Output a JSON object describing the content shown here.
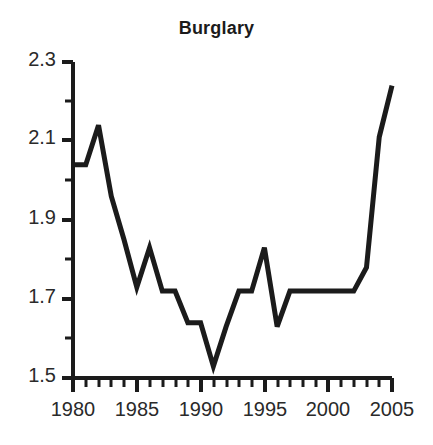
{
  "chart_data": {
    "type": "line",
    "title": "Burglary",
    "xlabel": "",
    "ylabel": "",
    "xlim": [
      1980,
      2005
    ],
    "ylim": [
      1.5,
      2.3
    ],
    "grid": false,
    "legend": null,
    "x_ticks": [
      1980,
      1985,
      1990,
      1995,
      2000,
      2005
    ],
    "x_tick_labels": [
      "1980",
      "1985",
      "1990",
      "1995",
      "2000",
      "2005"
    ],
    "x_minor_tick_interval": 1,
    "y_ticks": [
      1.5,
      1.7,
      1.9,
      2.1,
      2.3
    ],
    "y_tick_labels": [
      "1.5",
      "1.7",
      "1.9",
      "2.1",
      "2.3"
    ],
    "y_minor_ticks": [
      1.6,
      1.8,
      2.0,
      2.2
    ],
    "line_color": "#1b1b1b",
    "line_width": 5,
    "x": [
      1980,
      1981,
      1982,
      1983,
      1984,
      1985,
      1986,
      1987,
      1988,
      1989,
      1990,
      1991,
      1992,
      1993,
      1994,
      1995,
      1996,
      1997,
      1998,
      1999,
      2000,
      2001,
      2002,
      2003,
      2004,
      2005
    ],
    "values": [
      2.04,
      2.04,
      2.14,
      1.96,
      1.85,
      1.73,
      1.83,
      1.72,
      1.72,
      1.64,
      1.64,
      1.53,
      1.63,
      1.72,
      1.72,
      1.83,
      1.63,
      1.72,
      1.72,
      1.72,
      1.72,
      1.72,
      1.72,
      1.78,
      2.11,
      2.24
    ],
    "series": [
      {
        "name": "Burglary",
        "values": [
          2.04,
          2.04,
          2.14,
          1.96,
          1.85,
          1.73,
          1.83,
          1.72,
          1.72,
          1.64,
          1.64,
          1.53,
          1.63,
          1.72,
          1.72,
          1.83,
          1.63,
          1.72,
          1.72,
          1.72,
          1.72,
          1.72,
          1.72,
          1.78,
          2.11,
          2.24
        ]
      }
    ]
  },
  "axes": {
    "y_labels": [
      "2.3",
      "2.1",
      "1.9",
      "1.7",
      "1.5"
    ],
    "x_labels": [
      "1980",
      "1985",
      "1990",
      "1995",
      "2000",
      "2005"
    ]
  }
}
